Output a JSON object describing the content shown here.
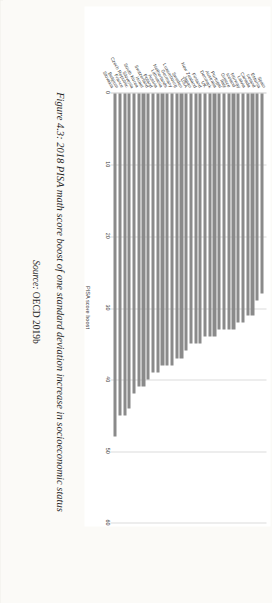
{
  "figure": {
    "caption": "Figure 4.3: 2018 PISA math score boost of one standard deviation increase in socioeconomic status",
    "source_prefix": "Source:",
    "source_text": "OECD 2019b"
  },
  "chart_data": {
    "type": "bar",
    "orientation": "horizontal",
    "title": "",
    "xlabel": "PISA score boost",
    "ylabel": "",
    "xlim": [
      0,
      60
    ],
    "xticks": [
      0,
      10,
      20,
      30,
      40,
      50,
      60
    ],
    "grid": true,
    "legend": "none",
    "bar_color": "#8a8a8a",
    "categories": [
      "Spain",
      "Estonia",
      "Ireland",
      "Canada",
      "Latvia",
      "Norway",
      "Iceland",
      "Greece",
      "Italy",
      "Portugal",
      "Australia",
      "Denmark",
      "UK",
      "Finland",
      "New Zealand",
      "Japan",
      "USA",
      "Sweden",
      "Luxembourg",
      "Germany",
      "Netherlands",
      "Lithuania",
      "Austria",
      "Poland",
      "Switzerland",
      "Israel",
      "South Korea",
      "Slovenia",
      "Czech Republic",
      "France",
      "Belgium",
      "Slovakia"
    ],
    "values": [
      28,
      29,
      31,
      31,
      32,
      32,
      33,
      33,
      33,
      33,
      34,
      34,
      34,
      35,
      35,
      35,
      36,
      37,
      37,
      38,
      38,
      38,
      39,
      39,
      40,
      41,
      41,
      42,
      44,
      45,
      45,
      48
    ]
  }
}
